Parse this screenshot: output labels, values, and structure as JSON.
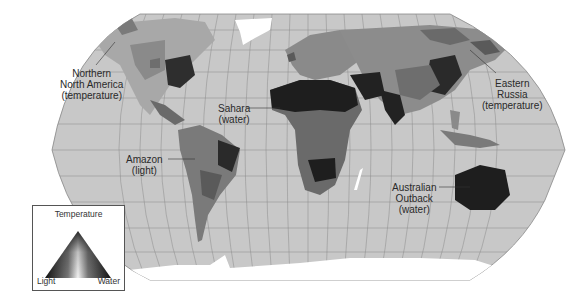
{
  "map": {
    "projection": "Robinson-style world map",
    "colors": {
      "ocean": "#c8c8c8",
      "graticule": "#8a8a8a",
      "ice": "#ffffff",
      "limit_light": "#7a7a7a",
      "limit_temperature": "#9a9a9a",
      "limit_water": "#1e1e1e",
      "mixed": "#5a5a5a"
    }
  },
  "labels": {
    "north_america": {
      "line1": "Northern",
      "line2": "North America",
      "line3": "(temperature)"
    },
    "eastern_russia": {
      "line1": "Eastern",
      "line2": "Russia",
      "line3": "(temperature)"
    },
    "sahara": {
      "line1": "Sahara",
      "line2": "(water)"
    },
    "amazon": {
      "line1": "Amazon",
      "line2": "(light)"
    },
    "australia": {
      "line1": "Australian",
      "line2": "Outback",
      "line3": "(water)"
    }
  },
  "legend": {
    "title": "Temperature",
    "left_label": "Light",
    "right_label": "Water"
  }
}
